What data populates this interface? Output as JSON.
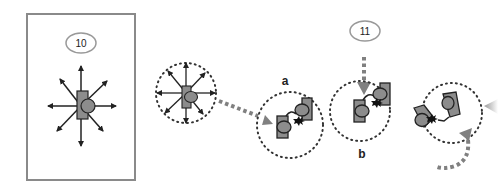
{
  "figure": {
    "panel_10": {
      "label": "10"
    },
    "stage_a": {
      "label": "a"
    },
    "stage_b": {
      "label": "b"
    },
    "panel_11": {
      "label": "11"
    }
  },
  "colors": {
    "frame": "#8a8a8a",
    "shape_fill": "#8c8c8c",
    "outline": "#222222",
    "dotted_arrow": "#808080",
    "dots": "#333333"
  }
}
